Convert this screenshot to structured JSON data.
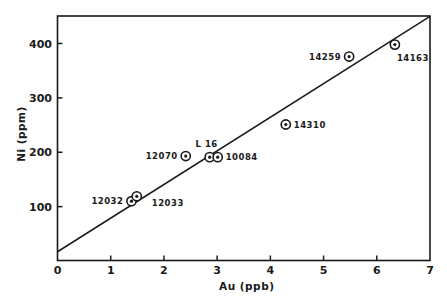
{
  "chart_data": {
    "type": "scatter",
    "title": "",
    "xlabel": "Au (ppb)",
    "ylabel": "Ni (ppm)",
    "xlim": [
      0,
      7
    ],
    "ylim": [
      0,
      450
    ],
    "grid": false,
    "legend": null,
    "x_ticks": [
      0,
      1,
      2,
      3,
      4,
      5,
      6,
      7
    ],
    "x_tick_labels": [
      "0",
      "1",
      "2",
      "3",
      "4",
      "5",
      "6",
      "7"
    ],
    "y_ticks": [
      100,
      200,
      300,
      400
    ],
    "y_tick_labels": [
      "100",
      "200",
      "300",
      "400"
    ],
    "marker": "circled-dot",
    "series": [
      {
        "name": "samples",
        "points": [
          {
            "label": "12032",
            "x": 1.39,
            "y": 110,
            "label_pos": "left"
          },
          {
            "label": "12033",
            "x": 1.49,
            "y": 119,
            "label_pos": "right-below"
          },
          {
            "label": "12070",
            "x": 2.41,
            "y": 193,
            "label_pos": "left"
          },
          {
            "label": "L 16",
            "x": 2.86,
            "y": 191,
            "label_pos": "above"
          },
          {
            "label": "10084",
            "x": 3.01,
            "y": 191,
            "label_pos": "right"
          },
          {
            "label": "14310",
            "x": 4.29,
            "y": 251,
            "label_pos": "right"
          },
          {
            "label": "14259",
            "x": 5.48,
            "y": 376,
            "label_pos": "left"
          },
          {
            "label": "14163",
            "x": 6.34,
            "y": 398,
            "label_pos": "right-below"
          }
        ]
      }
    ],
    "fit_line": {
      "x": [
        0,
        7
      ],
      "y": [
        17,
        450
      ]
    }
  }
}
